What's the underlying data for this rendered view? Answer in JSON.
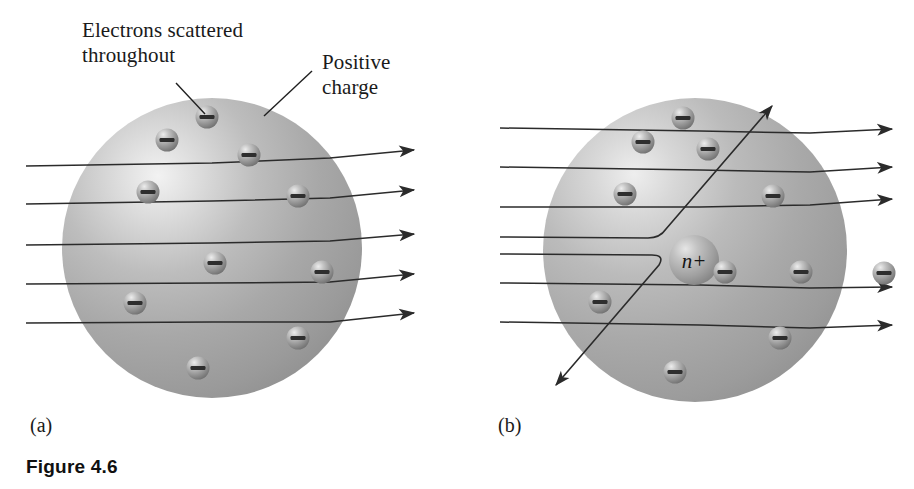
{
  "figure": {
    "caption": "Figure 4.6",
    "panels": [
      {
        "id": "a",
        "label": "(a)"
      },
      {
        "id": "b",
        "label": "(b)"
      }
    ]
  },
  "annotations": {
    "electrons_label": "Electrons scattered\nthroughout",
    "positive_label": "Positive\ncharge",
    "nucleus_label": "n+"
  },
  "colors": {
    "sphere_mid": "#a8a8a8",
    "sphere_highlight": "#e8e8e8",
    "sphere_shadow": "#8c8c8c",
    "electron_body": "#9a9a9a",
    "electron_highlight": "#e4e4e4",
    "electron_shadow": "#4a4a4a",
    "ray_stroke": "#2b2b2b",
    "text": "#1a1a1a",
    "background": "#ffffff"
  },
  "diagram_data": {
    "type": "scientific-illustration",
    "subject": "Thomson plum-pudding model versus Rutherford nuclear model alpha-particle scattering",
    "panel_a": {
      "sphere": {
        "cx": 212,
        "cy": 248,
        "r": 150
      },
      "electron_count": 10,
      "electrons": [
        {
          "cx": 207,
          "cy": 117
        },
        {
          "cx": 167,
          "cy": 140
        },
        {
          "cx": 249,
          "cy": 155
        },
        {
          "cx": 148,
          "cy": 192
        },
        {
          "cx": 298,
          "cy": 196
        },
        {
          "cx": 215,
          "cy": 263
        },
        {
          "cx": 322,
          "cy": 272
        },
        {
          "cx": 135,
          "cy": 303
        },
        {
          "cx": 298,
          "cy": 338
        },
        {
          "cx": 198,
          "cy": 368
        }
      ],
      "ray_count": 5,
      "rays": [
        {
          "y_in": 166,
          "y_out": 155
        },
        {
          "y_in": 204,
          "y_out": 196
        },
        {
          "y_in": 245,
          "y_out": 239
        },
        {
          "y_in": 284,
          "y_out": 279
        },
        {
          "y_in": 323,
          "y_out": 317
        }
      ],
      "ray_x_start": 26,
      "ray_x_end": 414
    },
    "panel_b": {
      "sphere": {
        "cx": 695,
        "cy": 250,
        "r": 152
      },
      "nucleus": {
        "cx": 694,
        "cy": 260,
        "r": 25
      },
      "electron_count": 11,
      "electrons": [
        {
          "cx": 683,
          "cy": 118
        },
        {
          "cx": 643,
          "cy": 142
        },
        {
          "cx": 708,
          "cy": 149
        },
        {
          "cx": 625,
          "cy": 194
        },
        {
          "cx": 773,
          "cy": 196
        },
        {
          "cx": 725,
          "cy": 272
        },
        {
          "cx": 801,
          "cy": 272
        },
        {
          "cx": 600,
          "cy": 302
        },
        {
          "cx": 780,
          "cy": 338
        },
        {
          "cx": 675,
          "cy": 372
        },
        {
          "cx": 884,
          "cy": 273
        }
      ],
      "straight_ray_count": 5,
      "straight_rays": [
        {
          "y_in": 128,
          "y_out": 132
        },
        {
          "y_in": 167,
          "y_out": 170
        },
        {
          "y_in": 207,
          "y_out": 202
        },
        {
          "y_in": 283,
          "y_out": 290
        },
        {
          "y_in": 322,
          "y_out": 328
        }
      ],
      "deflected_ray_count": 2,
      "deflected_rays": [
        {
          "y_in": 237,
          "kink_x": 660,
          "tip_x": 770,
          "tip_y": 108,
          "direction": "up-right"
        },
        {
          "y_in": 254,
          "kink_x": 665,
          "tip_x": 558,
          "tip_y": 383,
          "direction": "down-left"
        }
      ],
      "ray_x_start": 500,
      "ray_x_end": 892
    },
    "leaders": [
      {
        "name": "electrons-leader",
        "x1": 176,
        "y1": 83,
        "x2": 205,
        "y2": 114
      },
      {
        "name": "positive-leader",
        "x1": 312,
        "y1": 71,
        "x2": 264,
        "y2": 116
      }
    ]
  }
}
